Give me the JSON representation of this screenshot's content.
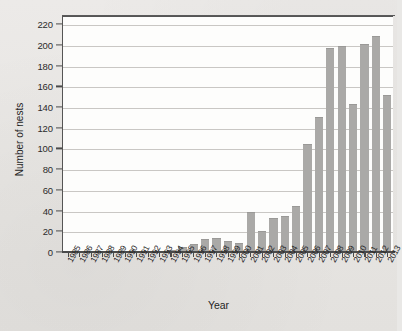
{
  "chart_data": {
    "type": "bar",
    "title": "",
    "xlabel": "Year",
    "ylabel": "Number of nests",
    "ylim": [
      0,
      228
    ],
    "yticks": [
      0,
      20,
      40,
      60,
      80,
      100,
      120,
      140,
      160,
      180,
      200,
      220
    ],
    "grid": true,
    "legend": false,
    "bar_color": "#aaa9a7",
    "categories": [
      "1985",
      "1986",
      "1987",
      "1988",
      "1989",
      "1990",
      "1991",
      "1992",
      "1993",
      "1994",
      "1995",
      "1996",
      "1997",
      "1998",
      "1999",
      "2000",
      "2001",
      "2002",
      "2003",
      "2004",
      "2005",
      "2006",
      "2007",
      "2008",
      "2009",
      "2010",
      "2011",
      "2012",
      "2013"
    ],
    "values": [
      1,
      0,
      0,
      1,
      0,
      0,
      1,
      0,
      1,
      2,
      5,
      8,
      13,
      14,
      11,
      9,
      39,
      20,
      33,
      35,
      44,
      104,
      130,
      197,
      199,
      143,
      201,
      209,
      152
    ]
  }
}
